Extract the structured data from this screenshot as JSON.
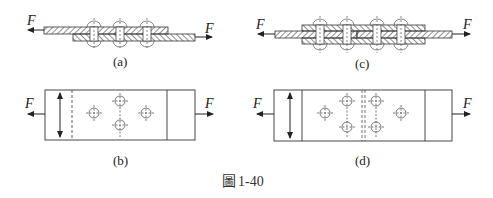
{
  "figure": {
    "caption_prefix": "圖",
    "caption_number": "1-40",
    "panels": [
      {
        "id": "a",
        "label": "(a)",
        "type": "lap-joint-section",
        "rivets": 3,
        "force_left": "F",
        "force_right": "F"
      },
      {
        "id": "b",
        "label": "(b)",
        "type": "lap-joint-plan",
        "rivets": 4,
        "force_left": "F",
        "force_right": "F"
      },
      {
        "id": "c",
        "label": "(c)",
        "type": "butt-joint-section",
        "rivets": 4,
        "force_left": "F",
        "force_right": "F"
      },
      {
        "id": "d",
        "label": "(d)",
        "type": "butt-joint-plan",
        "rivets": 6,
        "force_left": "F",
        "force_right": "F"
      }
    ]
  }
}
